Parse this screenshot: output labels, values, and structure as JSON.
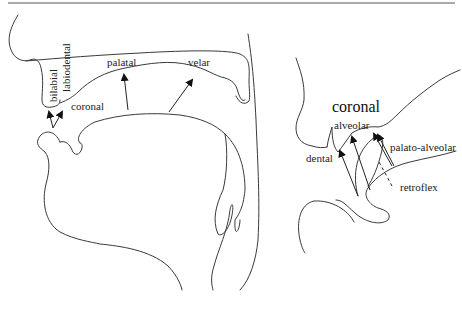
{
  "figure": {
    "left_panel": {
      "labels": {
        "bilabial": "bilabial",
        "labiodental": "labiodental",
        "coronal": "coronal",
        "palatal": "palatal",
        "velar": "velar"
      }
    },
    "right_panel": {
      "title": "coronal",
      "labels": {
        "alveolar": "alveolar",
        "dental": "dental",
        "palato_alveolar": "palato-alveolar",
        "retroflex": "retroflex"
      }
    }
  },
  "colors": {
    "line": "#3a3a3a",
    "text": "#222222",
    "rule": "#555555"
  }
}
